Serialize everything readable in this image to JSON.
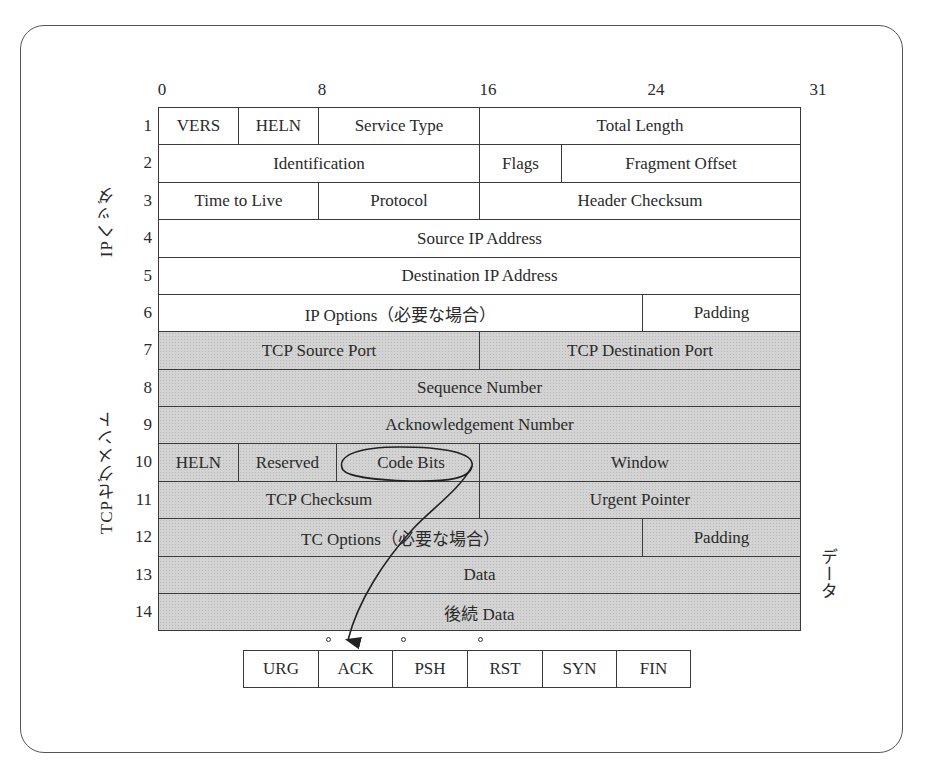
{
  "diagram": {
    "bit_positions": [
      "0",
      "8",
      "16",
      "24",
      "31"
    ],
    "sections": {
      "ip_header_label": "IPヘッダ",
      "tcp_segment_label": "TCPセグメント",
      "data_label": "データ"
    },
    "rows": [
      {
        "num": "1",
        "section": "ip",
        "fields": [
          {
            "label": "VERS",
            "bits": "0-3"
          },
          {
            "label": "HELN",
            "bits": "4-7"
          },
          {
            "label": "Service Type",
            "bits": "8-15"
          },
          {
            "label": "Total Length",
            "bits": "16-31"
          }
        ]
      },
      {
        "num": "2",
        "section": "ip",
        "fields": [
          {
            "label": "Identification",
            "bits": "0-15"
          },
          {
            "label": "Flags",
            "bits": "16-18"
          },
          {
            "label": "Fragment Offset",
            "bits": "19-31"
          }
        ]
      },
      {
        "num": "3",
        "section": "ip",
        "fields": [
          {
            "label": "Time to Live",
            "bits": "0-7"
          },
          {
            "label": "Protocol",
            "bits": "8-15"
          },
          {
            "label": "Header Checksum",
            "bits": "16-31"
          }
        ]
      },
      {
        "num": "4",
        "section": "ip",
        "fields": [
          {
            "label": "Source IP Address",
            "bits": "0-31"
          }
        ]
      },
      {
        "num": "5",
        "section": "ip",
        "fields": [
          {
            "label": "Destination IP Address",
            "bits": "0-31"
          }
        ]
      },
      {
        "num": "6",
        "section": "ip",
        "fields": [
          {
            "label": "IP Options（必要な場合）",
            "bits": "0-23"
          },
          {
            "label": "Padding",
            "bits": "24-31"
          }
        ]
      },
      {
        "num": "7",
        "section": "tcp",
        "fields": [
          {
            "label": "TCP Source Port",
            "bits": "0-15"
          },
          {
            "label": "TCP Destination Port",
            "bits": "16-31"
          }
        ]
      },
      {
        "num": "8",
        "section": "tcp",
        "fields": [
          {
            "label": "Sequence Number",
            "bits": "0-31"
          }
        ]
      },
      {
        "num": "9",
        "section": "tcp",
        "fields": [
          {
            "label": "Acknowledgement Number",
            "bits": "0-31"
          }
        ]
      },
      {
        "num": "10",
        "section": "tcp",
        "fields": [
          {
            "label": "HELN",
            "bits": "0-3"
          },
          {
            "label": "Reserved",
            "bits": "4-9"
          },
          {
            "label": "Code Bits",
            "bits": "10-15"
          },
          {
            "label": "Window",
            "bits": "16-31"
          }
        ]
      },
      {
        "num": "11",
        "section": "tcp",
        "fields": [
          {
            "label": "TCP Checksum",
            "bits": "0-15"
          },
          {
            "label": "Urgent Pointer",
            "bits": "16-31"
          }
        ]
      },
      {
        "num": "12",
        "section": "tcp",
        "fields": [
          {
            "label": "TC Options（必要な場合）",
            "bits": "0-23"
          },
          {
            "label": "Padding",
            "bits": "24-31"
          }
        ]
      },
      {
        "num": "13",
        "section": "tcp",
        "fields": [
          {
            "label": "Data",
            "bits": "0-31"
          }
        ]
      },
      {
        "num": "14",
        "section": "tcp",
        "fields": [
          {
            "label": "後続 Data",
            "bits": "0-31"
          }
        ]
      }
    ],
    "code_bits": {
      "flags": [
        "URG",
        "ACK",
        "PSH",
        "RST",
        "SYN",
        "FIN"
      ],
      "marked_boundaries": [
        "URG|ACK",
        "ACK|PSH",
        "PSH|RST"
      ]
    },
    "colors": {
      "ip_fill": "#ffffff",
      "tcp_fill": "#d3d3d3",
      "line": "#3a3a3a"
    }
  }
}
